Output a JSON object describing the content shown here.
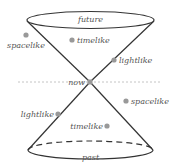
{
  "diagram": {
    "labels": {
      "future": "future",
      "past": "past",
      "now": "now",
      "spacelike_upper": "spacelike",
      "timelike_upper": "timelike",
      "lightlike_upper": "lightlike",
      "lightlike_lower": "lightlike",
      "spacelike_lower": "spacelike",
      "timelike_lower": "timelike"
    },
    "colors": {
      "line": "#333333",
      "dot": "#999999",
      "dashed_plane": "#bbbbbb",
      "text": "#555555"
    }
  }
}
